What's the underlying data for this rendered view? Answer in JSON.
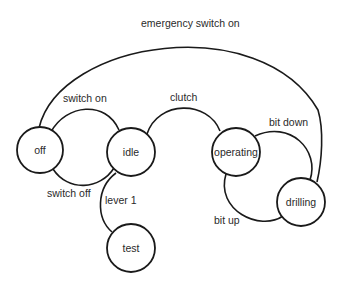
{
  "diagram": {
    "type": "state-transition",
    "states": [
      {
        "id": "off",
        "label": "off"
      },
      {
        "id": "idle",
        "label": "idle"
      },
      {
        "id": "operating",
        "label": "operating"
      },
      {
        "id": "drilling",
        "label": "drilling"
      },
      {
        "id": "test",
        "label": "test"
      }
    ],
    "transitions": [
      {
        "from": "off",
        "to": "drilling",
        "label": "emergency switch on"
      },
      {
        "from": "off",
        "to": "idle",
        "label": "switch on"
      },
      {
        "from": "idle",
        "to": "off",
        "label": "switch off"
      },
      {
        "from": "idle",
        "to": "operating",
        "label": "clutch"
      },
      {
        "from": "idle",
        "to": "test",
        "label": "lever 1"
      },
      {
        "from": "operating",
        "to": "drilling",
        "label": "bit down"
      },
      {
        "from": "drilling",
        "to": "operating",
        "label": "bit up"
      }
    ],
    "colors": {
      "stroke": "#1a1a1a",
      "text": "#2a2a2a",
      "background": "#ffffff"
    }
  }
}
